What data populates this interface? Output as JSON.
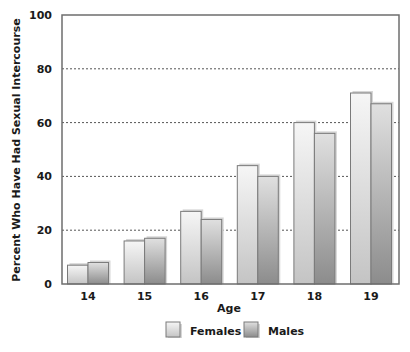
{
  "chart_data": {
    "type": "bar",
    "title": "",
    "xlabel": "Age",
    "ylabel": "Percent Who Have Had Sexual Intercourse",
    "categories": [
      "14",
      "15",
      "16",
      "17",
      "18",
      "19"
    ],
    "series": [
      {
        "name": "Females",
        "values": [
          7,
          16,
          27,
          44,
          60,
          71
        ]
      },
      {
        "name": "Males",
        "values": [
          8,
          17,
          24,
          40,
          56,
          67
        ]
      }
    ],
    "ylim": [
      0,
      100
    ],
    "yticks": [
      0,
      20,
      40,
      60,
      80,
      100
    ],
    "grid": {
      "y": true,
      "style": "dotted"
    },
    "legend": {
      "position": "bottom",
      "entries": [
        "Females",
        "Males"
      ]
    }
  },
  "style": {
    "axis_color": "#6e6e6e",
    "grid_color": "#555555",
    "female_fill_light": "#f4f4f4",
    "female_fill_dark": "#c6c6c6",
    "male_fill_light": "#dcdcdc",
    "male_fill_dark": "#8e8e8e",
    "bar_stroke": "#7a7a7a",
    "shadow": "#d6d6d6"
  }
}
